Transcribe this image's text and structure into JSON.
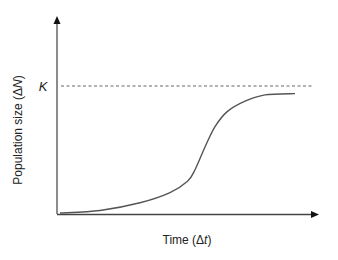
{
  "chart_data": {
    "type": "line",
    "title": "",
    "xlabel": "Time (Δt)",
    "ylabel": "Population size (ΔN)",
    "xlabel_parts": {
      "pre": "Time (Δ",
      "var": "t",
      "post": ")"
    },
    "ylabel_parts": {
      "pre": "Population size (Δ",
      "var": "N",
      "post": ")"
    },
    "annotations": [
      {
        "text": "K",
        "description": "carrying capacity, dashed horizontal asymptote"
      }
    ],
    "grid": false,
    "legend": null,
    "axis_ticks": "none",
    "series": [
      {
        "name": "Logistic growth (sigmoid)",
        "x": [
          0,
          0.16,
          0.32,
          0.44,
          0.51,
          0.54,
          0.58,
          0.62,
          0.67,
          0.74,
          0.82,
          0.94
        ],
        "y": [
          0.0,
          0.02,
          0.08,
          0.16,
          0.25,
          0.34,
          0.52,
          0.68,
          0.8,
          0.88,
          0.93,
          0.94
        ]
      }
    ],
    "reference_lines": [
      {
        "type": "horizontal",
        "label": "K",
        "y": 1.0,
        "style": "dashed"
      }
    ],
    "xlim": [
      0,
      1
    ],
    "ylim": [
      0,
      1.55
    ]
  }
}
